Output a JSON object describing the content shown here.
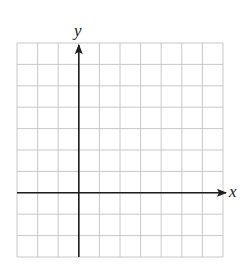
{
  "diagram": {
    "type": "coordinate-grid",
    "axes": {
      "x_label": "x",
      "y_label": "y"
    },
    "grid": {
      "columns": 10,
      "rows": 10,
      "x_range": [
        -3,
        7
      ],
      "y_range": [
        -3,
        7
      ],
      "origin_column_index": 3,
      "origin_row_index_from_top": 7
    },
    "colors": {
      "grid_line": "#c8c8c8",
      "axis": "#1e1e1e",
      "background": "#ffffff"
    }
  },
  "chart_data": {
    "type": "grid",
    "title": "",
    "xlabel": "x",
    "ylabel": "y",
    "xlim": [
      -3,
      7
    ],
    "ylim": [
      -3,
      7
    ],
    "grid": true,
    "series": [],
    "annotations": []
  }
}
